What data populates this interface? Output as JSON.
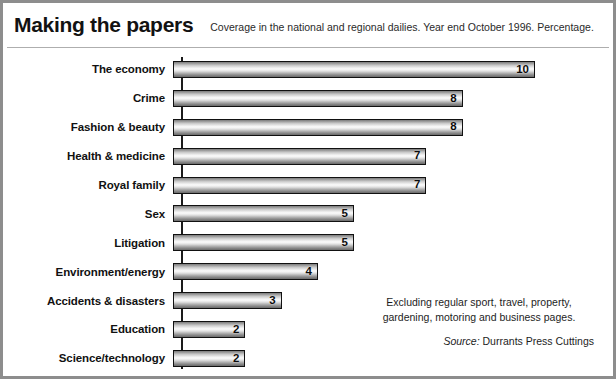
{
  "header": {
    "title": "Making the papers",
    "subtitle": "Coverage in the national and regional dailies. Year end October 1996. Percentage."
  },
  "footnote": {
    "note": "Excluding regular sport, travel, property, gardening, motoring and business pages.",
    "source_label": "Source:",
    "source_name": "Durrants Press Cuttings"
  },
  "colors": {
    "frame": "#8d8d8d",
    "bar_outline": "#111111",
    "text": "#111111",
    "rule": "#aeaeae"
  },
  "chart_data": {
    "type": "bar",
    "orientation": "horizontal",
    "title": "Making the papers",
    "subtitle": "Coverage in the national and regional dailies. Year end October 1996. Percentage.",
    "xlabel": "Percentage",
    "ylabel": "",
    "xlim": [
      0,
      10
    ],
    "grid": false,
    "legend": false,
    "value_labels": true,
    "categories": [
      "The economy",
      "Crime",
      "Fashion & beauty",
      "Health & medicine",
      "Royal family",
      "Sex",
      "Litigation",
      "Environment/energy",
      "Accidents & disasters",
      "Education",
      "Science/technology"
    ],
    "values": [
      10,
      8,
      8,
      7,
      7,
      5,
      5,
      4,
      3,
      2,
      2
    ],
    "labels": [
      "10",
      "8",
      "8",
      "7",
      "7",
      "5",
      "5",
      "4",
      "3",
      "2",
      "2"
    ]
  }
}
